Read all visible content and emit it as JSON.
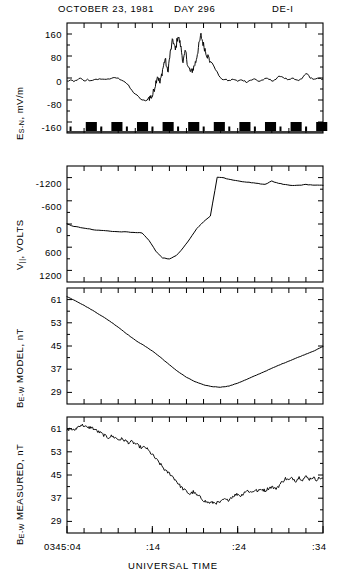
{
  "header": {
    "date": "OCTOBER 23, 1981",
    "day": "DAY 296",
    "spacecraft": "DE-I"
  },
  "xaxis": {
    "title": "UNIVERSAL TIME",
    "tick_labels": [
      "0345:04",
      ":14",
      ":24",
      ":34"
    ],
    "tick_values": [
      0,
      10,
      20,
      30
    ],
    "range": [
      0,
      30
    ],
    "minor_tick_interval": 2
  },
  "panels": [
    {
      "id": "panel-es-n",
      "ylabel_main": "E",
      "ylabel_sub": "S-N",
      "ylabel_rest": ", mV/m",
      "ylabel_full": "E S-N , mV/m",
      "yticks": [
        "160",
        "80",
        "0",
        "-80",
        "-160"
      ],
      "ytick_values": [
        160,
        80,
        0,
        -80,
        -160
      ],
      "ylim": [
        -200,
        200
      ],
      "has_marker_strip": true
    },
    {
      "id": "panel-v-parallel",
      "ylabel_main": "V",
      "ylabel_sub": "||",
      "ylabel_rest": ", VOLTS",
      "ylabel_full": "V || , VOLTS",
      "yticks": [
        "-1200",
        "-600",
        "0",
        "600",
        "1200"
      ],
      "ytick_values": [
        -1200,
        -600,
        0,
        600,
        1200
      ],
      "ylim": [
        1500,
        -1500
      ],
      "has_marker_strip": false
    },
    {
      "id": "panel-b-model",
      "ylabel_main": "B",
      "ylabel_sub": "E-W",
      "ylabel_rest": " MODEL, nT",
      "ylabel_full": "B E-W MODEL, nT",
      "yticks": [
        "61",
        "53",
        "45",
        "37",
        "29"
      ],
      "ytick_values": [
        61,
        53,
        45,
        37,
        29
      ],
      "ylim": [
        25,
        65
      ],
      "has_marker_strip": false
    },
    {
      "id": "panel-b-measured",
      "ylabel_main": "B",
      "ylabel_sub": "E-W",
      "ylabel_rest": " MEASURED, nT",
      "ylabel_full": "B E-W MEASURED, nT",
      "yticks": [
        "61",
        "53",
        "45",
        "37",
        "29"
      ],
      "ytick_values": [
        61,
        53,
        45,
        37,
        29
      ],
      "ylim": [
        25,
        65
      ],
      "has_marker_strip": false
    }
  ],
  "chart_data": {
    "type": "line",
    "title": "OCTOBER 23, 1981   DAY 296   DE-I",
    "xlabel": "UNIVERSAL TIME",
    "x_tick_labels": [
      "0345:04",
      ":14",
      ":24",
      ":34"
    ],
    "x_range_minutes": [
      0,
      30
    ],
    "grid": false,
    "legend": "none",
    "series": [
      {
        "name": "E_S-N (mV/m)",
        "panel": "panel-es-n",
        "ylabel": "E S-N, mV/m",
        "ylim": [
          -200,
          200
        ],
        "yticks": [
          160,
          80,
          0,
          -80,
          -160
        ],
        "x": [
          0.0,
          0.4,
          0.8,
          1.2,
          1.6,
          2.0,
          2.4,
          2.8,
          3.2,
          3.6,
          4.0,
          4.4,
          4.8,
          5.2,
          5.6,
          6.0,
          6.4,
          6.8,
          7.2,
          7.6,
          8.0,
          8.4,
          8.8,
          9.2,
          9.6,
          10.0,
          10.3,
          10.6,
          10.9,
          11.2,
          11.5,
          11.8,
          12.1,
          12.4,
          12.7,
          13.0,
          13.3,
          13.6,
          13.9,
          14.2,
          14.5,
          14.8,
          15.1,
          15.4,
          15.7,
          16.0,
          16.4,
          16.8,
          17.2,
          17.6,
          18.0,
          18.5,
          19.0,
          19.5,
          20.0,
          20.5,
          21.0,
          21.5,
          22.0,
          22.5,
          23.0,
          23.5,
          24.0,
          24.5,
          25.0,
          25.5,
          26.0,
          26.5,
          27.0,
          27.5,
          28.0,
          28.5,
          29.0,
          29.5,
          30.0
        ],
        "y": [
          -12,
          -8,
          -14,
          -6,
          -2,
          -12,
          -6,
          -10,
          -4,
          -8,
          -2,
          -6,
          -2,
          -4,
          2,
          -2,
          -6,
          -14,
          -28,
          -46,
          -58,
          -70,
          -80,
          -84,
          -72,
          -66,
          -30,
          10,
          -20,
          30,
          70,
          20,
          90,
          140,
          100,
          155,
          120,
          60,
          95,
          40,
          20,
          35,
          60,
          110,
          155,
          120,
          85,
          60,
          45,
          20,
          -2,
          -6,
          -10,
          -4,
          -12,
          -6,
          -14,
          -8,
          -4,
          -12,
          -6,
          -2,
          -10,
          -4,
          8,
          0,
          -8,
          -2,
          -10,
          -4,
          18,
          2,
          -6,
          -2,
          -4
        ]
      },
      {
        "name": "V_parallel (VOLTS)",
        "panel": "panel-v-parallel",
        "ylabel": "V ||, VOLTS",
        "ylim_display_inverted": true,
        "yticks": [
          -1200,
          -600,
          0,
          600,
          1200
        ],
        "x": [
          0.0,
          0.8,
          1.6,
          2.4,
          3.2,
          4.0,
          4.8,
          5.6,
          6.4,
          7.2,
          8.0,
          8.8,
          9.6,
          10.4,
          11.2,
          12.0,
          12.8,
          13.6,
          14.4,
          15.2,
          16.0,
          16.8,
          17.6,
          18.4,
          19.2,
          20.0,
          20.8,
          21.6,
          22.4,
          23.2,
          24.0,
          24.8,
          25.6,
          26.4,
          27.2,
          28.0,
          28.8,
          29.6,
          30.0
        ],
        "y": [
          0,
          60,
          90,
          120,
          150,
          170,
          180,
          200,
          200,
          210,
          220,
          230,
          420,
          700,
          880,
          900,
          820,
          620,
          380,
          120,
          -60,
          -200,
          -1210,
          -1190,
          -1150,
          -1120,
          -1090,
          -1070,
          -1050,
          -1020,
          -1110,
          -1050,
          -1020,
          -1000,
          -1000,
          -1020,
          -1010,
          -1000,
          -1000
        ]
      },
      {
        "name": "B_E-W MODEL (nT)",
        "panel": "panel-b-model",
        "ylabel": "B E-W MODEL, nT",
        "ylim": [
          25,
          65
        ],
        "yticks": [
          61,
          53,
          45,
          37,
          29
        ],
        "x": [
          0.0,
          1.0,
          2.0,
          3.0,
          4.0,
          5.0,
          6.0,
          7.0,
          8.0,
          9.0,
          10.0,
          11.0,
          12.0,
          13.0,
          14.0,
          15.0,
          16.0,
          17.0,
          18.0,
          19.0,
          20.0,
          21.0,
          22.0,
          23.0,
          24.0,
          25.0,
          26.0,
          27.0,
          28.0,
          29.0,
          30.0
        ],
        "y": [
          62.0,
          60.6,
          59.0,
          57.3,
          55.5,
          53.6,
          51.5,
          49.2,
          47.0,
          45.2,
          43.3,
          41.0,
          38.5,
          36.2,
          34.2,
          32.7,
          31.6,
          31.0,
          30.8,
          31.2,
          32.2,
          33.4,
          34.7,
          36.0,
          37.3,
          38.6,
          39.8,
          41.0,
          42.2,
          43.4,
          44.8
        ]
      },
      {
        "name": "B_E-W MEASURED (nT)",
        "panel": "panel-b-measured",
        "ylabel": "B E-W MEASURED, nT",
        "ylim": [
          25,
          65
        ],
        "yticks": [
          61,
          53,
          45,
          37,
          29
        ],
        "x": [
          0.0,
          0.4,
          0.8,
          1.2,
          1.6,
          2.0,
          2.4,
          2.8,
          3.2,
          3.6,
          4.0,
          4.4,
          4.8,
          5.2,
          5.6,
          6.0,
          6.4,
          6.8,
          7.2,
          7.6,
          8.0,
          8.4,
          8.8,
          9.2,
          9.6,
          10.0,
          10.4,
          10.8,
          11.2,
          11.6,
          12.0,
          12.4,
          12.8,
          13.2,
          13.6,
          14.0,
          14.4,
          14.8,
          15.2,
          15.6,
          16.0,
          16.4,
          16.8,
          17.2,
          17.6,
          18.0,
          18.4,
          18.8,
          19.2,
          19.6,
          20.0,
          20.4,
          20.8,
          21.2,
          21.6,
          22.0,
          22.4,
          22.8,
          23.2,
          23.6,
          24.0,
          24.4,
          24.8,
          25.2,
          25.6,
          26.0,
          26.4,
          26.8,
          27.2,
          27.6,
          28.0,
          28.4,
          28.8,
          29.2,
          29.6,
          30.0
        ],
        "y": [
          60.5,
          61.0,
          60.3,
          61.4,
          62.3,
          62.0,
          61.2,
          61.5,
          60.8,
          60.0,
          59.4,
          58.6,
          57.9,
          58.4,
          58.0,
          57.2,
          57.4,
          56.9,
          56.2,
          56.4,
          55.8,
          55.0,
          54.3,
          54.6,
          53.2,
          52.0,
          50.6,
          49.2,
          47.8,
          46.2,
          45.6,
          44.4,
          43.0,
          41.4,
          40.2,
          39.3,
          38.4,
          39.2,
          38.0,
          37.4,
          36.3,
          35.6,
          35.4,
          35.5,
          35.4,
          35.6,
          36.6,
          36.2,
          37.2,
          38.0,
          38.4,
          37.8,
          39.2,
          39.6,
          39.0,
          39.8,
          39.4,
          40.2,
          39.6,
          40.4,
          41.0,
          40.2,
          41.2,
          42.6,
          43.8,
          43.2,
          44.0,
          43.0,
          44.2,
          43.4,
          44.4,
          43.6,
          44.2,
          43.4,
          44.0,
          43.8
        ]
      }
    ],
    "marker_strip": {
      "panel": "panel-es-n",
      "description": "row of black block markers below the E_S-N trace",
      "block_starts": [
        2.2,
        5.2,
        8.2,
        11.2,
        14.2,
        17.2,
        20.2,
        23.2,
        26.2,
        29.2
      ],
      "block_width": 1.3,
      "small_tick_positions": [
        0.3,
        3.9,
        6.9,
        9.9,
        12.9,
        15.9,
        18.9,
        21.9,
        24.9,
        27.9
      ]
    }
  }
}
